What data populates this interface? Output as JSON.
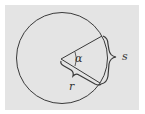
{
  "diagram": {
    "background_color": "#e4e4e4",
    "stroke_color": "#3a3a3a",
    "labels": {
      "angle": "α",
      "arc": "s",
      "radius": "r"
    }
  }
}
